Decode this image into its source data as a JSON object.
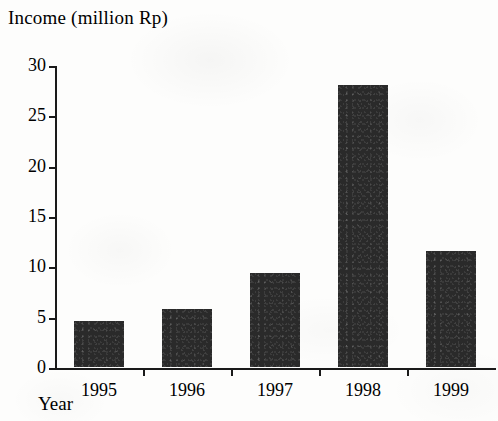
{
  "chart_data": {
    "type": "bar",
    "title": "Income (million Rp)",
    "xlabel": "Year",
    "ylabel": "Income (million Rp)",
    "categories": [
      "1995",
      "1996",
      "1997",
      "1998",
      "1999"
    ],
    "values": [
      4.6,
      5.8,
      9.3,
      28.0,
      11.5
    ],
    "series": [
      {
        "name": "Income (million Rp)",
        "values": [
          4.6,
          5.8,
          9.3,
          28.0,
          11.5
        ]
      }
    ],
    "ylim": [
      0,
      30
    ],
    "y_ticks": [
      0,
      5,
      10,
      15,
      20,
      25,
      30
    ],
    "y_tick_labels": [
      "0",
      "5",
      "10",
      "15",
      "20",
      "25",
      "30"
    ],
    "grid": false,
    "legend": false,
    "legend_position": "none",
    "bar_color": "#2a2a2a",
    "axis_color": "#1a1a1a",
    "background_color": "#fdfdfc"
  }
}
